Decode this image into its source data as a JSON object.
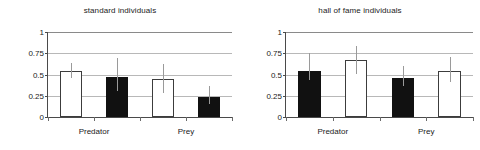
{
  "chart_data": [
    {
      "type": "bar",
      "title": "standard individuals",
      "xlabel": "",
      "ylabel": "",
      "ylim": [
        0,
        1
      ],
      "yticks": [
        "0",
        "0.25",
        "0.5",
        "0.75",
        "1"
      ],
      "ytick_values": [
        0,
        0.25,
        0.5,
        0.75,
        1
      ],
      "grid": true,
      "legend": "none",
      "categories": [
        "Predator",
        "Prey"
      ],
      "bars": [
        {
          "group": "Predator",
          "fill": "white",
          "value": 0.54,
          "err_low": 0.46,
          "err_high": 0.63
        },
        {
          "group": "Predator",
          "fill": "black",
          "value": 0.47,
          "err_low": 0.3,
          "err_high": 0.69
        },
        {
          "group": "Prey",
          "fill": "white",
          "value": 0.45,
          "err_low": 0.28,
          "err_high": 0.62
        },
        {
          "group": "Prey",
          "fill": "black",
          "value": 0.24,
          "err_low": 0.15,
          "err_high": 0.37
        }
      ]
    },
    {
      "type": "bar",
      "title": "hall of fame individuals",
      "xlabel": "",
      "ylabel": "",
      "ylim": [
        0,
        1
      ],
      "yticks": [
        "0",
        "0.25",
        "0.5",
        "0.75",
        "1"
      ],
      "ytick_values": [
        0,
        0.25,
        0.5,
        0.75,
        1
      ],
      "grid": true,
      "legend": "none",
      "categories": [
        "Predator",
        "Prey"
      ],
      "bars": [
        {
          "group": "Predator",
          "fill": "black",
          "value": 0.54,
          "err_low": 0.44,
          "err_high": 0.75
        },
        {
          "group": "Predator",
          "fill": "white",
          "value": 0.67,
          "err_low": 0.5,
          "err_high": 0.83
        },
        {
          "group": "Prey",
          "fill": "black",
          "value": 0.46,
          "err_low": 0.36,
          "err_high": 0.6
        },
        {
          "group": "Prey",
          "fill": "white",
          "value": 0.54,
          "err_low": 0.41,
          "err_high": 0.71
        }
      ]
    }
  ]
}
